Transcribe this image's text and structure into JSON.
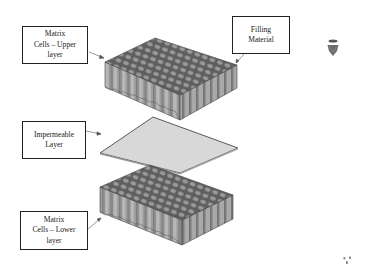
{
  "diagram": {
    "labels": {
      "upper": {
        "lines": [
          "Matrix",
          "Cells – Upper",
          "layer"
        ]
      },
      "filling": {
        "lines": [
          "Filling",
          "Material"
        ]
      },
      "impermeable": {
        "lines": [
          "Impermeable",
          "Layer"
        ]
      },
      "lower": {
        "lines": [
          "Matrix",
          "Cells – Lower",
          "layer"
        ]
      }
    },
    "components": [
      {
        "name": "Matrix Cells - Upper layer",
        "shape": "hexagonal honeycomb block"
      },
      {
        "name": "Impermeable Layer",
        "shape": "flat plate"
      },
      {
        "name": "Matrix Cells - Lower layer",
        "shape": "hexagonal honeycomb block"
      }
    ],
    "colors": {
      "cell_top": "#8a8a8a",
      "cell_side_light": "#b5b5b5",
      "cell_side_dark": "#6f6f6f",
      "plate": "#d6d6d6",
      "outline": "#333333",
      "label_border": "#222222"
    },
    "decorations": {
      "top_right_icon": "shield-shaped-logo",
      "bottom_right_icon": "small-mark"
    }
  }
}
